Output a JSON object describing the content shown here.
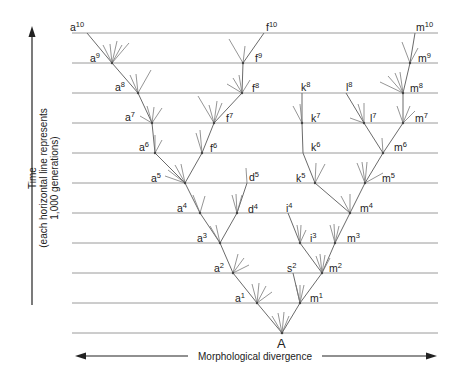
{
  "figure": {
    "root_label": "A",
    "y_axis": {
      "label": "Time",
      "sublabel_line1": "(each horizontal line represents",
      "sublabel_line2": "1,000 generations)"
    },
    "x_axis": {
      "label": "Morphological divergence"
    },
    "generation_lines": {
      "count": 11,
      "y_positions": [
        33,
        63,
        93,
        123,
        153,
        183,
        213,
        243,
        273,
        303,
        333
      ],
      "x_start": 72,
      "x_end": 438
    },
    "colors": {
      "lines": "#9a9a9a",
      "branches": "#6a6a6a",
      "text": "#222222"
    },
    "nodes": [
      {
        "id": "A",
        "base": "",
        "sup": "",
        "x": 282,
        "y": 333
      },
      {
        "id": "a1",
        "base": "a",
        "sup": "1",
        "x": 257,
        "y": 303
      },
      {
        "id": "a2",
        "base": "a",
        "sup": "2",
        "x": 233,
        "y": 273
      },
      {
        "id": "a3",
        "base": "a",
        "sup": "3",
        "x": 220,
        "y": 243
      },
      {
        "id": "a4",
        "base": "a",
        "sup": "4",
        "x": 200,
        "y": 213
      },
      {
        "id": "a5",
        "base": "a",
        "sup": "5",
        "x": 185,
        "y": 183
      },
      {
        "id": "a6",
        "base": "a",
        "sup": "6",
        "x": 155,
        "y": 153
      },
      {
        "id": "a7",
        "base": "a",
        "sup": "7",
        "x": 152,
        "y": 123
      },
      {
        "id": "a8",
        "base": "a",
        "sup": "8",
        "x": 138,
        "y": 93
      },
      {
        "id": "a9",
        "base": "a",
        "sup": "9",
        "x": 112,
        "y": 63
      },
      {
        "id": "a10",
        "base": "a",
        "sup": "10",
        "x": 87,
        "y": 33
      },
      {
        "id": "d4",
        "base": "d",
        "sup": "4",
        "x": 237,
        "y": 213
      },
      {
        "id": "d5",
        "base": "d",
        "sup": "5",
        "x": 247,
        "y": 183
      },
      {
        "id": "f6",
        "base": "f",
        "sup": "6",
        "x": 202,
        "y": 153
      },
      {
        "id": "f7",
        "base": "f",
        "sup": "7",
        "x": 214,
        "y": 123
      },
      {
        "id": "f8",
        "base": "f",
        "sup": "8",
        "x": 242,
        "y": 93
      },
      {
        "id": "f9",
        "base": "f",
        "sup": "9",
        "x": 243,
        "y": 63
      },
      {
        "id": "f10",
        "base": "f",
        "sup": "10",
        "x": 264,
        "y": 33
      },
      {
        "id": "m1",
        "base": "m",
        "sup": "1",
        "x": 300,
        "y": 303
      },
      {
        "id": "m2",
        "base": "m",
        "sup": "2",
        "x": 322,
        "y": 273
      },
      {
        "id": "m3",
        "base": "m",
        "sup": "3",
        "x": 335,
        "y": 243
      },
      {
        "id": "m4",
        "base": "m",
        "sup": "4",
        "x": 350,
        "y": 213
      },
      {
        "id": "m5",
        "base": "m",
        "sup": "5",
        "x": 365,
        "y": 183
      },
      {
        "id": "m6",
        "base": "m",
        "sup": "6",
        "x": 383,
        "y": 153
      },
      {
        "id": "m7",
        "base": "m",
        "sup": "7",
        "x": 403,
        "y": 123
      },
      {
        "id": "m8",
        "base": "m",
        "sup": "8",
        "x": 403,
        "y": 93
      },
      {
        "id": "m9",
        "base": "m",
        "sup": "9",
        "x": 410,
        "y": 63
      },
      {
        "id": "m10",
        "base": "m",
        "sup": "10",
        "x": 415,
        "y": 33
      },
      {
        "id": "s2",
        "base": "s",
        "sup": "2",
        "x": 293,
        "y": 273
      },
      {
        "id": "i3",
        "base": "i",
        "sup": "3",
        "x": 300,
        "y": 243
      },
      {
        "id": "i4",
        "base": "i",
        "sup": "4",
        "x": 288,
        "y": 213
      },
      {
        "id": "k5",
        "base": "k",
        "sup": "5",
        "x": 315,
        "y": 183
      },
      {
        "id": "k6",
        "base": "k",
        "sup": "6",
        "x": 303,
        "y": 153
      },
      {
        "id": "k7",
        "base": "k",
        "sup": "7",
        "x": 302,
        "y": 123
      },
      {
        "id": "k8",
        "base": "k",
        "sup": "8",
        "x": 302,
        "y": 93
      },
      {
        "id": "l7",
        "base": "l",
        "sup": "7",
        "x": 364,
        "y": 123
      },
      {
        "id": "l8",
        "base": "l",
        "sup": "8",
        "x": 346,
        "y": 93
      }
    ]
  }
}
